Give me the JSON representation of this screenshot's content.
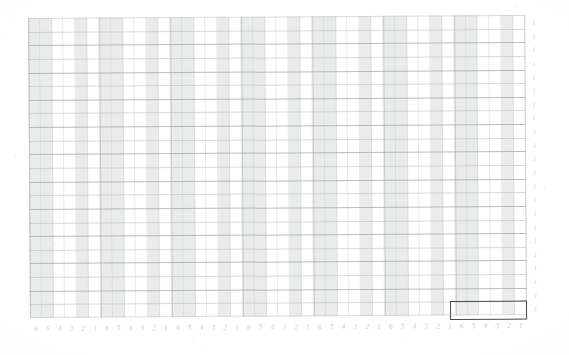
{
  "document": {
    "type": "scanned-ledger-grid",
    "background_color": "#ffffff",
    "paper_tone": "#fefefe",
    "rotation_degrees": -0.35
  },
  "grid": {
    "left": 30,
    "top": 18,
    "width": 497,
    "height": 300,
    "column_count": 42,
    "group_count": 7,
    "columns_per_group": 6,
    "row_count": 22,
    "row_height": 13.6,
    "column_width": 11.83,
    "shaded_color": "#dddede",
    "line_color": "#babcbc",
    "group_line_color": "#b2b4b4",
    "shading_pattern_in_group": [
      true,
      true,
      false,
      false,
      true,
      false
    ]
  },
  "column_labels": {
    "sequence": [
      "6",
      "5",
      "4",
      "3",
      "2",
      "1"
    ],
    "repeat_count": 7,
    "color": "#c4c6c6",
    "font_size_px": 7.5,
    "style": "italic"
  },
  "row_labels": {
    "values": [
      "1",
      "1",
      "1",
      "1",
      "1",
      "1",
      "1",
      "1",
      "1",
      "1",
      "1",
      "1",
      "1",
      "1",
      "1",
      "1",
      "1",
      "1",
      "1",
      "1",
      "1",
      "1"
    ],
    "color": "#cdcfcf",
    "font_size_px": 7,
    "style": "italic"
  },
  "highlight": {
    "label": "selected-row-region",
    "left": 450,
    "top": 301,
    "width": 77,
    "height": 19,
    "border_color": "#4a4a4a",
    "border_width_px": 1.6,
    "spans_columns": 6,
    "spans_group_index": 7,
    "covered_column_labels": [
      "6",
      "5",
      "4",
      "3",
      "2",
      "1"
    ]
  }
}
